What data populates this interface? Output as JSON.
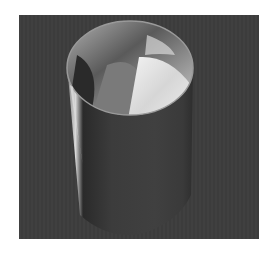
{
  "image": {
    "subject": "stainless steel cylindrical waste bin with white liner bag",
    "colors": {
      "page_background": "#ffffff",
      "photo_background": "#3d3d3d",
      "steel_dark": "#3a3a3a",
      "steel_mid": "#6e6e6e",
      "steel_light": "#c8c8c8",
      "liner_white": "#e8e8e8"
    }
  }
}
